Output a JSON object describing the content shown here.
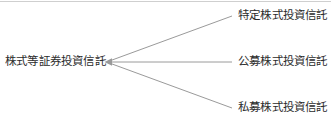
{
  "diagram": {
    "type": "branching-tree",
    "orientation": "left-root-right-children",
    "root": {
      "label": "株式等証券投資信託"
    },
    "children": [
      {
        "label": "特定株式投資信託"
      },
      {
        "label": "公募株式投資信託"
      },
      {
        "label": "私募株式投資信託"
      }
    ],
    "connectors": {
      "arrow_direction": "left",
      "junction": {
        "x": 105,
        "y": 62
      },
      "endpoints": [
        {
          "x": 232,
          "y": 16
        },
        {
          "x": 232,
          "y": 62
        },
        {
          "x": 232,
          "y": 108
        }
      ]
    },
    "colors": {
      "line": "#9a9a9a",
      "text": "#2b2b2b",
      "background": "#ffffff",
      "top_rule": "#cfcfcf"
    }
  }
}
